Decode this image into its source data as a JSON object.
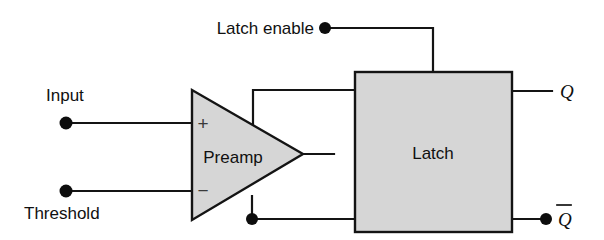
{
  "diagram": {
    "colors": {
      "block_fill": "#d6d6d6",
      "line": "#141414",
      "background": "#ffffff",
      "text": "#101010"
    },
    "blocks": [
      {
        "id": "preamp",
        "shape": "triangle",
        "label": "Preamp",
        "x": 192,
        "y": 90,
        "width": 111,
        "height": 130
      },
      {
        "id": "latch",
        "shape": "rectangle",
        "label": "Latch",
        "x": 355,
        "y": 72,
        "width": 157,
        "height": 160
      }
    ],
    "pin_labels": {
      "plus": "+",
      "minus": "−"
    },
    "terminals": [
      {
        "id": "input",
        "label": "Input",
        "x": 66,
        "y": 123,
        "label_x": 46,
        "label_y": 101,
        "anchor": "start"
      },
      {
        "id": "threshold",
        "label": "Threshold",
        "x": 66,
        "y": 191,
        "label_x": 24,
        "label_y": 219,
        "anchor": "start"
      },
      {
        "id": "latch-enable",
        "label": "Latch enable",
        "x": 325,
        "y": 28,
        "label_x": 314,
        "label_y": 34,
        "anchor": "end"
      },
      {
        "id": "q-bar-out",
        "label": "",
        "x": 546,
        "y": 219,
        "label_x": 0,
        "label_y": 0,
        "anchor": "start"
      }
    ],
    "outputs": [
      {
        "id": "q",
        "label": "Q",
        "overbar": false,
        "label_x": 560,
        "label_y": 98
      },
      {
        "id": "q-bar",
        "label": "Q",
        "overbar": true,
        "label_x": 558,
        "label_y": 226
      }
    ],
    "junctions": [
      {
        "id": "preamp-feedback-junction",
        "x": 252,
        "y": 219
      }
    ]
  }
}
